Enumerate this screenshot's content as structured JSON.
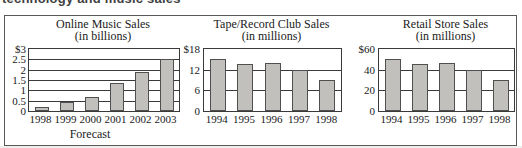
{
  "page": {
    "top_caption": "technology and music sales"
  },
  "colors": {
    "bar_fill": "#c1c0bc",
    "bar_border": "#4f4f4f",
    "grid_line": "#3a3a3a",
    "frame": "#3a3a3a",
    "panel_border": "#595959",
    "text": "#1a1a1a"
  },
  "chart_data": [
    {
      "type": "bar",
      "title": "Online Music Sales",
      "subtitle": "(in billions)",
      "categories": [
        "1998",
        "1999",
        "2000",
        "2001",
        "2002",
        "2003"
      ],
      "values": [
        0.2,
        0.45,
        0.7,
        1.35,
        1.9,
        2.5
      ],
      "ylim": [
        0,
        3
      ],
      "ytick_values": [
        3,
        2.5,
        2,
        1.5,
        1,
        0.5,
        0
      ],
      "ytick_labels": [
        "$3",
        "2.5",
        "2",
        "1.5",
        "1",
        "0.5",
        "0"
      ],
      "gridline_values": [
        2.5,
        2,
        1.5,
        1,
        0.5
      ],
      "footnote": "Forecast",
      "legend": null,
      "grid": "horizontal"
    },
    {
      "type": "bar",
      "title": "Tape/Record Club Sales",
      "subtitle": "(in millions)",
      "categories": [
        "1994",
        "1995",
        "1996",
        "1997",
        "1998"
      ],
      "values": [
        15,
        13.5,
        14,
        12,
        9
      ],
      "ylim": [
        0,
        18
      ],
      "ytick_values": [
        18,
        12,
        6,
        0
      ],
      "ytick_labels": [
        "$18",
        "12",
        "6",
        "0"
      ],
      "gridline_values": [
        12,
        6
      ],
      "footnote": null,
      "legend": null,
      "grid": "horizontal"
    },
    {
      "type": "bar",
      "title": "Retail Store Sales",
      "subtitle": "(in millions)",
      "categories": [
        "1994",
        "1995",
        "1996",
        "1997",
        "1998"
      ],
      "values": [
        50,
        45,
        46,
        40,
        30
      ],
      "ylim": [
        0,
        60
      ],
      "ytick_values": [
        60,
        40,
        20,
        0
      ],
      "ytick_labels": [
        "$60",
        "40",
        "20",
        "0"
      ],
      "gridline_values": [
        40,
        20
      ],
      "footnote": null,
      "legend": null,
      "grid": "horizontal"
    }
  ]
}
